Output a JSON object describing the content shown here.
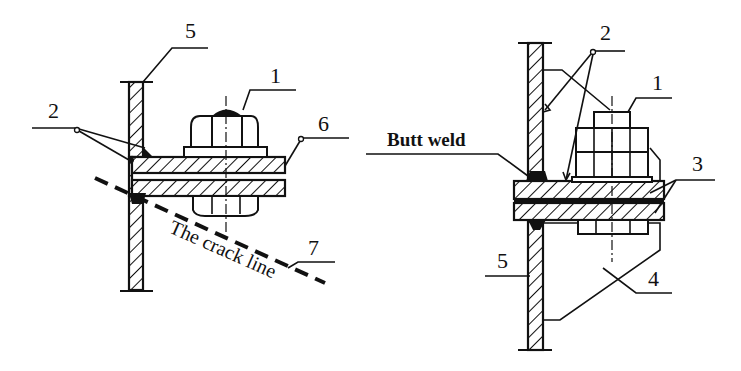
{
  "figure": {
    "left_panel": {
      "labels": {
        "bolt": "1",
        "weld": "2",
        "plate": "5",
        "bracket": "6",
        "crack": "7"
      },
      "annotation": "The crack line"
    },
    "right_panel": {
      "labels": {
        "bolt": "1",
        "weld": "2",
        "gusset_plate": "3",
        "stiffener": "4",
        "plate": "5"
      },
      "annotation": "Butt weld"
    },
    "colors": {
      "ink": "#111111",
      "background": "#ffffff"
    }
  }
}
